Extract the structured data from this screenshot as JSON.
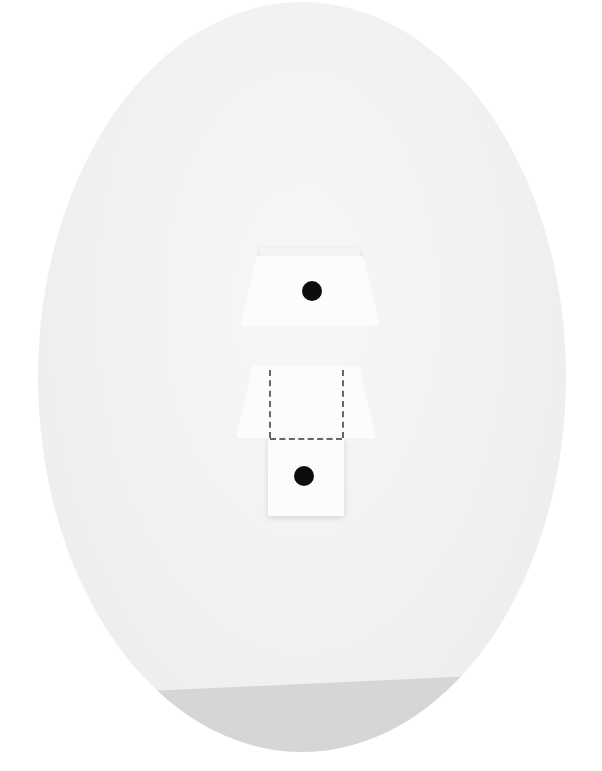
{
  "scene": {
    "description": "Paper fold model on an oval white background",
    "background_color": "#ffffff",
    "oval_color": "#f1f1f1",
    "shadow_color": "#d6d6d6"
  },
  "pieces": [
    {
      "name": "top-folded-piece",
      "has_dot": true,
      "dashed_lines": false
    },
    {
      "name": "bottom-unfolded-piece",
      "has_dot": true,
      "dashed_lines": true
    }
  ],
  "colors": {
    "paper": "#fcfcfc",
    "dot": "#0d0d0d",
    "dash": "#666666"
  }
}
